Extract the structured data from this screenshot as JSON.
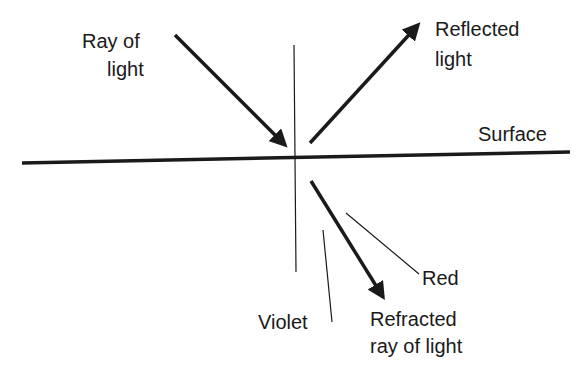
{
  "diagram": {
    "labels": {
      "incident_line1": "Ray of",
      "incident_line2": "light",
      "reflected_line1": "Reflected",
      "reflected_line2": "light",
      "surface": "Surface",
      "red": "Red",
      "violet": "Violet",
      "refracted_line1": "Refracted",
      "refracted_line2": "ray of light"
    },
    "colors": {
      "line": "#1a1a1a",
      "background": "#ffffff"
    },
    "geometry": {
      "surface": [
        22,
        163,
        570,
        152
      ],
      "normal": [
        294,
        45,
        296,
        272
      ],
      "incident_ray": [
        175,
        35,
        285,
        145
      ],
      "reflected_ray": [
        310,
        143,
        418,
        25
      ],
      "refracted_ray": [
        311,
        181,
        383,
        297
      ],
      "violet_leader": [
        323,
        230,
        332,
        322
      ],
      "red_leader": [
        346,
        213,
        419,
        274
      ]
    }
  }
}
